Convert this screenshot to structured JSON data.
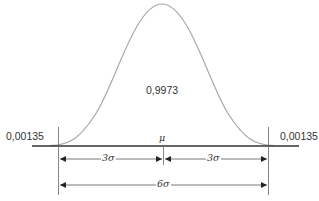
{
  "diagram": {
    "center_probability": "0,9973",
    "left_tail_probability": "0,00135",
    "right_tail_probability": "0,00135",
    "mean_label": "μ",
    "left_half_width_label": "3σ",
    "right_half_width_label": "3σ",
    "total_width_label": "6σ",
    "colors": {
      "curve": "#a8a8a8",
      "axis": "#333333",
      "lines": "#555555",
      "text": "#333333"
    }
  }
}
